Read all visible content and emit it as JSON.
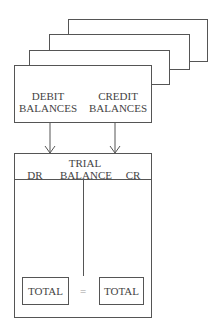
{
  "ledger_stack": {
    "front_box": {
      "debit_label_line1": "DEBIT",
      "debit_label_line2": "BALANCES",
      "credit_label_line1": "CREDIT",
      "credit_label_line2": "BALANCES"
    }
  },
  "trial_balance": {
    "title_line1": "TRIAL",
    "title_line2": "BALANCE",
    "dr_label": "DR",
    "cr_label": "CR",
    "left_total": "TOTAL",
    "equals": "=",
    "right_total": "TOTAL"
  },
  "colors": {
    "line": "#555555",
    "text": "#444444",
    "equals": "#999999"
  }
}
